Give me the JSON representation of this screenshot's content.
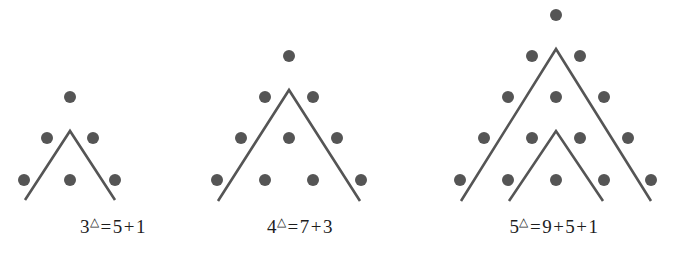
{
  "figure": {
    "background_color": "#ffffff",
    "dot_color": "#555555",
    "line_color": "#555555",
    "dot_radius": 6,
    "line_width": 2.6,
    "panels": [
      {
        "id": "panel-1",
        "n": 3,
        "caption": {
          "base": "3",
          "exponent": "△",
          "equals": "=",
          "terms": [
            "5",
            "1"
          ],
          "operators": [
            "+"
          ],
          "full_text": "3△ = 5 + 1"
        },
        "rows": [
          {
            "row": 1,
            "count": 1,
            "y": 97,
            "xs": [
              70
            ]
          },
          {
            "row": 2,
            "count": 2,
            "y": 138,
            "xs": [
              47,
              93
            ]
          },
          {
            "row": 3,
            "count": 3,
            "y": 180,
            "xs": [
              24,
              70,
              115
            ]
          }
        ],
        "chevrons": [
          {
            "apex_x": 70,
            "apex_y": 131,
            "left_x": 25,
            "right_x": 115,
            "bottom_y": 200
          }
        ],
        "total_dots": 6
      },
      {
        "id": "panel-2",
        "n": 4,
        "caption": {
          "base": "4",
          "exponent": "△",
          "equals": "=",
          "terms": [
            "7",
            "3"
          ],
          "operators": [
            "+"
          ],
          "full_text": "4△ = 7 + 3"
        },
        "rows": [
          {
            "row": 1,
            "count": 1,
            "y": 56,
            "xs": [
              289
            ]
          },
          {
            "row": 2,
            "count": 2,
            "y": 97,
            "xs": [
              265,
              313
            ]
          },
          {
            "row": 3,
            "count": 3,
            "y": 138,
            "xs": [
              241,
              289,
              337
            ]
          },
          {
            "row": 4,
            "count": 4,
            "y": 180,
            "xs": [
              217,
              265,
              313,
              361
            ]
          }
        ],
        "chevrons": [
          {
            "apex_x": 289,
            "apex_y": 90,
            "left_x": 218,
            "right_x": 360,
            "bottom_y": 201
          }
        ],
        "total_dots": 10
      },
      {
        "id": "panel-3",
        "n": 5,
        "caption": {
          "base": "5",
          "exponent": "△",
          "equals": "=",
          "terms": [
            "9",
            "5",
            "1"
          ],
          "operators": [
            "+",
            "+"
          ],
          "full_text": "5△ = 9 + 5 + 1"
        },
        "rows": [
          {
            "row": 1,
            "count": 1,
            "y": 15,
            "xs": [
              556
            ]
          },
          {
            "row": 2,
            "count": 2,
            "y": 56,
            "xs": [
              532,
              580
            ]
          },
          {
            "row": 3,
            "count": 3,
            "y": 97,
            "xs": [
              508,
              556,
              604
            ]
          },
          {
            "row": 4,
            "count": 4,
            "y": 138,
            "xs": [
              484,
              532,
              580,
              628
            ]
          },
          {
            "row": 5,
            "count": 5,
            "y": 180,
            "xs": [
              460,
              508,
              556,
              604,
              651
            ]
          }
        ],
        "chevrons": [
          {
            "apex_x": 556,
            "apex_y": 49,
            "left_x": 461,
            "right_x": 651,
            "bottom_y": 201
          },
          {
            "apex_x": 556,
            "apex_y": 131,
            "left_x": 509,
            "right_x": 603,
            "bottom_y": 201
          }
        ],
        "total_dots": 15
      }
    ]
  }
}
